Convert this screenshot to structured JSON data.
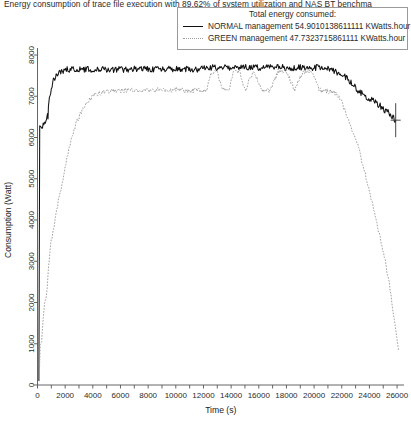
{
  "chart_data": {
    "type": "line",
    "title": "Energy consumption of trace file execution with 89.62% of system utilization and NAS BT benchma",
    "xlabel": "Time (s)",
    "ylabel": "Consumption (Watt)",
    "xlim": [
      0,
      26500
    ],
    "ylim": [
      0,
      8400
    ],
    "grid": false,
    "legend_position": "top-right",
    "legend_title": "Total energy consumed:",
    "xticks": [
      0,
      2000,
      4000,
      6000,
      8000,
      10000,
      12000,
      14000,
      16000,
      18000,
      20000,
      22000,
      24000,
      26000
    ],
    "xtick_labels": [
      "0",
      "2000",
      "4000",
      "6000",
      "8000",
      "10000",
      "12000",
      "14000",
      "16000",
      "18000",
      "20000",
      "22000",
      "24000",
      "26000"
    ],
    "xminor_step": 1000,
    "yticks": [
      0,
      1000,
      2000,
      3000,
      4000,
      5000,
      6000,
      7000,
      8000
    ],
    "ytick_labels": [
      "0",
      "1000",
      "2000",
      "3000",
      "4000",
      "5000",
      "6000",
      "7000",
      "8000"
    ],
    "series": [
      {
        "name": "NORMAL management",
        "label": "NORMAL management 54.9010138611111 KWatts.hour",
        "total_energy_kwh": 54.9010138611111,
        "energy_units": "KWatts.hour",
        "color": "#111111",
        "style": "solid",
        "x": [
          100,
          160,
          260,
          360,
          460,
          560,
          700,
          760,
          820,
          900,
          1000,
          1150,
          1300,
          1500,
          1800,
          2200,
          2800,
          3600,
          4500,
          5500,
          6500,
          7500,
          8500,
          9500,
          10500,
          11500,
          12500,
          13500,
          14500,
          15500,
          16500,
          17500,
          18500,
          19500,
          20500,
          21000,
          21500,
          22000,
          22500,
          23000,
          23500,
          24000,
          24500,
          25000,
          25400,
          25700,
          25900
        ],
        "y": [
          100,
          6300,
          6320,
          6280,
          6350,
          6300,
          6600,
          6520,
          6900,
          7050,
          7200,
          7380,
          7480,
          7560,
          7620,
          7650,
          7660,
          7650,
          7660,
          7650,
          7655,
          7660,
          7650,
          7655,
          7660,
          7650,
          7690,
          7700,
          7690,
          7700,
          7690,
          7700,
          7690,
          7700,
          7690,
          7680,
          7600,
          7560,
          7400,
          7200,
          7050,
          6950,
          6850,
          6700,
          6600,
          6500,
          6420
        ]
      },
      {
        "name": "GREEN management",
        "label": "GREEN management 47.7323715861111 KWatts.hour",
        "total_energy_kwh": 47.7323715861111,
        "energy_units": "KWatts.hour",
        "color": "#9d9d9d",
        "style": "dotted",
        "x": [
          120,
          200,
          300,
          420,
          520,
          620,
          720,
          800,
          900,
          1000,
          1150,
          1300,
          1450,
          1600,
          1750,
          1900,
          2050,
          2200,
          2400,
          2700,
          3000,
          3500,
          4200,
          5000,
          5800,
          6200,
          6600,
          7000,
          7400,
          7800,
          8200,
          8800,
          9400,
          10000,
          10600,
          11200,
          11800,
          12200,
          12600,
          13000,
          13400,
          13800,
          14200,
          14600,
          15000,
          15600,
          16200,
          16800,
          17400,
          18000,
          18600,
          19200,
          19800,
          20400,
          21000,
          21400,
          21800,
          22200,
          22500,
          22800,
          23100,
          23400,
          23700,
          24000,
          24300,
          24600,
          24900,
          25200,
          25500,
          25800,
          26100
        ],
        "y": [
          90,
          980,
          1050,
          1700,
          2000,
          2050,
          2450,
          2900,
          3250,
          3500,
          3750,
          4050,
          4350,
          4600,
          4850,
          5100,
          5350,
          5600,
          5900,
          6250,
          6500,
          6820,
          7050,
          7120,
          7140,
          7140,
          7150,
          7140,
          7150,
          7140,
          7145,
          7150,
          7140,
          7150,
          7145,
          7140,
          7150,
          7120,
          7580,
          7600,
          7150,
          7140,
          7600,
          7620,
          7140,
          7600,
          7150,
          7140,
          7600,
          7610,
          7150,
          7600,
          7610,
          7140,
          7120,
          7100,
          7000,
          6700,
          6400,
          6150,
          5900,
          5500,
          5100,
          4700,
          4300,
          3850,
          3400,
          2900,
          2300,
          1600,
          850
        ]
      }
    ]
  }
}
